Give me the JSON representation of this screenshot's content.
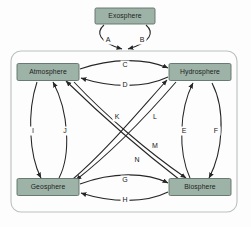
{
  "diagram": {
    "background_color": "#fdfdfd",
    "box_fill_color": "#9db3a7",
    "box_stroke_color": "#5d6f66",
    "arrow_color": "#262626",
    "container_stroke_color": "#b9c2c0",
    "nodes": [
      {
        "id": "exosphere",
        "label": "Exosphere",
        "x": 125,
        "y": 16,
        "w": 60,
        "h": 16,
        "inside_container": false
      },
      {
        "id": "atmosphere",
        "label": "Atmosphere",
        "x": 48,
        "y": 72,
        "w": 62,
        "h": 17,
        "inside_container": true
      },
      {
        "id": "hydrosphere",
        "label": "Hydrosphere",
        "x": 200,
        "y": 72,
        "w": 62,
        "h": 17,
        "inside_container": true
      },
      {
        "id": "geosphere",
        "label": "Geosphere",
        "x": 48,
        "y": 187,
        "w": 62,
        "h": 17,
        "inside_container": true
      },
      {
        "id": "biosphere",
        "label": "Biosphere",
        "x": 200,
        "y": 187,
        "w": 62,
        "h": 17,
        "inside_container": true
      }
    ],
    "container": {
      "x": 11,
      "y": 51,
      "w": 226,
      "h": 161,
      "radius": 10
    },
    "edges": [
      {
        "label": "A",
        "from": "exosphere",
        "to": "container-top",
        "label_x": 108,
        "label_y": 40
      },
      {
        "label": "B",
        "from": "exosphere",
        "to": "container-top",
        "label_x": 142,
        "label_y": 40
      },
      {
        "label": "C",
        "from": "atmosphere",
        "to": "hydrosphere",
        "label_x": 125,
        "label_y": 65
      },
      {
        "label": "D",
        "from": "hydrosphere",
        "to": "atmosphere",
        "label_x": 125,
        "label_y": 85
      },
      {
        "label": "E",
        "from": "biosphere",
        "to": "hydrosphere",
        "label_x": 184,
        "label_y": 131
      },
      {
        "label": "F",
        "from": "hydrosphere",
        "to": "biosphere",
        "label_x": 216,
        "label_y": 131
      },
      {
        "label": "G",
        "from": "geosphere",
        "to": "biosphere",
        "label_x": 125,
        "label_y": 180
      },
      {
        "label": "H",
        "from": "biosphere",
        "to": "geosphere",
        "label_x": 125,
        "label_y": 200
      },
      {
        "label": "I",
        "from": "atmosphere",
        "to": "geosphere",
        "label_x": 33,
        "label_y": 131
      },
      {
        "label": "J",
        "from": "geosphere",
        "to": "atmosphere",
        "label_x": 65,
        "label_y": 131
      },
      {
        "label": "K",
        "from": "geosphere",
        "to": "hydrosphere",
        "label_x": 117,
        "label_y": 117
      },
      {
        "label": "L",
        "from": "hydrosphere",
        "to": "geosphere",
        "label_x": 155,
        "label_y": 117
      },
      {
        "label": "M",
        "from": "atmosphere",
        "to": "biosphere",
        "label_x": 155,
        "label_y": 146
      },
      {
        "label": "N",
        "from": "biosphere",
        "to": "atmosphere",
        "label_x": 137,
        "label_y": 160
      }
    ]
  }
}
